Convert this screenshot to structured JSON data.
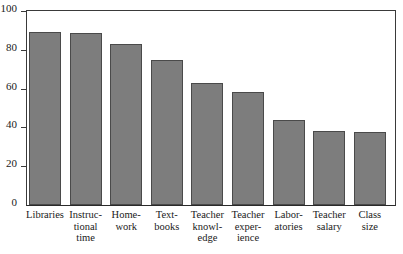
{
  "chart_data": {
    "type": "bar",
    "title": "",
    "xlabel": "",
    "ylabel": "",
    "ylim": [
      0,
      100
    ],
    "yticks": [
      0,
      20,
      40,
      60,
      80,
      100
    ],
    "grid": false,
    "legend": null,
    "categories": [
      "Libraries",
      "Instructional time",
      "Homework",
      "Textbooks",
      "Teacher knowledge",
      "Teacher experience",
      "Laboratories",
      "Teacher salary",
      "Class size"
    ],
    "category_label_lines": [
      [
        "Libraries"
      ],
      [
        "Instruc-",
        "tional",
        "time"
      ],
      [
        "Home-",
        "work"
      ],
      [
        "Text-",
        "books"
      ],
      [
        "Teacher",
        "knowl-",
        "edge"
      ],
      [
        "Teacher",
        "exper-",
        "ience"
      ],
      [
        "Labor-",
        "atories"
      ],
      [
        "Teacher",
        "salary"
      ],
      [
        "Class",
        "size"
      ]
    ],
    "values": [
      89,
      88.5,
      83,
      74.5,
      63,
      58.5,
      44,
      38,
      37.5
    ],
    "colors": {
      "bar_fill": "#7d7d7d",
      "bar_edge": "#4a4a4a",
      "axis": "#3a3a3a",
      "text": "#1a1a1a",
      "background": "#ffffff"
    }
  }
}
